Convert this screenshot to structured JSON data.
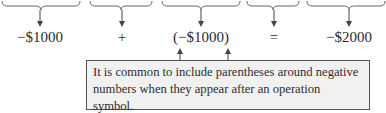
{
  "figure": {
    "top_labels_cropped": [
      "",
      "",
      "",
      "",
      ""
    ],
    "terms": [
      {
        "id": "term1",
        "text": "−$1000",
        "x": 40
      },
      {
        "id": "plus",
        "text": "+",
        "x": 122
      },
      {
        "id": "term2",
        "text": "(−$1000)",
        "x": 201
      },
      {
        "id": "equals",
        "text": "=",
        "x": 274
      },
      {
        "id": "result",
        "text": "−$2000",
        "x": 349
      }
    ],
    "callout": {
      "text": "It is common to include parentheses around negative numbers when they appear after an operation symbol."
    },
    "colors": {
      "stroke": "#555555",
      "callout_fill": "#f1f1f1",
      "text": "#2a2a2a"
    }
  }
}
